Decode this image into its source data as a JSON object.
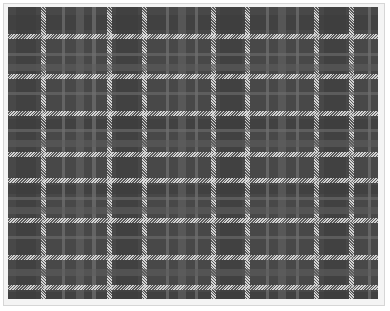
{
  "heading": {
    "text": "",
    "note_visible": "cropped bold heading glyph bottoms only"
  },
  "image": {
    "subject": "plaid-tartan-fabric",
    "description": "Gray tartan plaid pattern with white hatched stripes on dark charcoal base",
    "colors": {
      "base": "#484848",
      "dark_band": "#3c3c3c",
      "mid_band": "#5e5e5e",
      "light_band": "#6e6e6e",
      "stripe": "#e6e6e6",
      "frame_border": "#d6d6d6"
    },
    "vertical_stripes": [
      {
        "x": 33,
        "w": 5,
        "kind": "hatch"
      },
      {
        "x": 99,
        "w": 5,
        "kind": "hatch"
      },
      {
        "x": 134,
        "w": 5,
        "kind": "hatch"
      },
      {
        "x": 203,
        "w": 5,
        "kind": "hatch"
      },
      {
        "x": 237,
        "w": 5,
        "kind": "hatch"
      },
      {
        "x": 306,
        "w": 5,
        "kind": "hatch"
      },
      {
        "x": 341,
        "w": 5,
        "kind": "hatch"
      },
      {
        "x": 54,
        "w": 3,
        "kind": "light"
      },
      {
        "x": 68,
        "w": 8,
        "kind": "mid"
      },
      {
        "x": 84,
        "w": 4,
        "kind": "light"
      },
      {
        "x": 158,
        "w": 3,
        "kind": "light"
      },
      {
        "x": 170,
        "w": 8,
        "kind": "mid"
      },
      {
        "x": 187,
        "w": 3,
        "kind": "light"
      },
      {
        "x": 258,
        "w": 3,
        "kind": "light"
      },
      {
        "x": 270,
        "w": 8,
        "kind": "mid"
      },
      {
        "x": 288,
        "w": 3,
        "kind": "light"
      },
      {
        "x": 360,
        "w": 3,
        "kind": "light"
      }
    ],
    "horizontal_stripes": [
      {
        "y": 27,
        "w": 5,
        "kind": "hatch"
      },
      {
        "y": 67,
        "w": 5,
        "kind": "hatch"
      },
      {
        "y": 104,
        "w": 5,
        "kind": "hatch"
      },
      {
        "y": 145,
        "w": 5,
        "kind": "hatch"
      },
      {
        "y": 171,
        "w": 5,
        "kind": "hatch"
      },
      {
        "y": 211,
        "w": 5,
        "kind": "hatch"
      },
      {
        "y": 248,
        "w": 5,
        "kind": "hatch"
      },
      {
        "y": 278,
        "w": 5,
        "kind": "hatch"
      },
      {
        "y": 46,
        "w": 3,
        "kind": "light"
      },
      {
        "y": 57,
        "w": 7,
        "kind": "mid"
      },
      {
        "y": 85,
        "w": 3,
        "kind": "light"
      },
      {
        "y": 122,
        "w": 3,
        "kind": "light"
      },
      {
        "y": 133,
        "w": 7,
        "kind": "mid"
      },
      {
        "y": 190,
        "w": 3,
        "kind": "light"
      },
      {
        "y": 200,
        "w": 7,
        "kind": "mid"
      },
      {
        "y": 229,
        "w": 3,
        "kind": "light"
      },
      {
        "y": 262,
        "w": 7,
        "kind": "mid"
      }
    ]
  }
}
